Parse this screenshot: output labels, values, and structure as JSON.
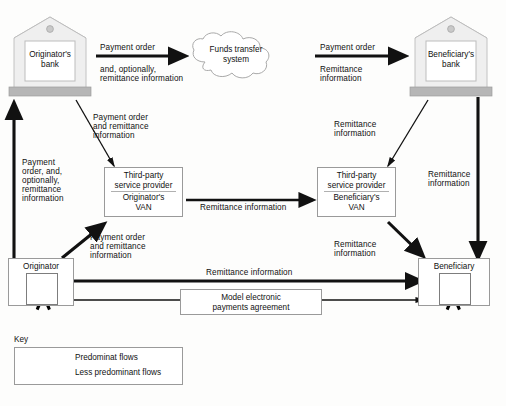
{
  "diagram": {
    "nodes": {
      "originator_bank": {
        "line1": "Originator's",
        "line2": "bank",
        "icon": "bank-icon"
      },
      "beneficiary_bank": {
        "line1": "Beneficiary's",
        "line2": "bank",
        "icon": "bank-icon"
      },
      "funds_transfer_system": {
        "line1": "Funds transfer",
        "line2": "system",
        "shape": "cloud"
      },
      "originator_van": {
        "header1": "Third-party",
        "header2": "service provider",
        "line1": "Originator's",
        "line2": "VAN"
      },
      "beneficiary_van": {
        "header1": "Third-party",
        "header2": "service provider",
        "line1": "Beneficiary's",
        "line2": "VAN"
      },
      "originator": {
        "label": "Originator",
        "icon": "person-icon"
      },
      "beneficiary": {
        "label": "Beneficiary",
        "icon": "person-icon"
      },
      "model_agreement": {
        "line1": "Model electronic",
        "line2": "payments agreement"
      }
    },
    "edge_labels": {
      "ob_to_fts_1": "Payment order",
      "ob_to_fts_2": "and, optionally,",
      "ob_to_fts_3": "remittance information",
      "fts_to_bb_1": "Payment order",
      "fts_to_bb_2": "Remittance",
      "fts_to_bb_3": "information",
      "ob_to_ovan_1": "Payment order",
      "ob_to_ovan_2": "and remittance",
      "ob_to_ovan_3": "information",
      "bb_to_bvan_1": "Remittance",
      "bb_to_bvan_2": "information",
      "ob_up_1": "Payment",
      "ob_up_2": "order, and,",
      "ob_up_3": "optionally,",
      "ob_up_4": "remittance",
      "ob_up_5": "information",
      "bb_down_1": "Remittance",
      "bb_down_2": "information",
      "van_to_van": "Remittance information",
      "orig_to_ovan_1": "Payment order",
      "orig_to_ovan_2": "and remittance",
      "orig_to_ovan_3": "information",
      "bvan_to_benef_1": "Remittance",
      "bvan_to_benef_2": "information",
      "orig_to_benef": "Remittance information"
    },
    "key": {
      "title": "Key",
      "items": [
        {
          "label": "Predominat flows",
          "style": "thick-arrow"
        },
        {
          "label": "Less predominant flows",
          "style": "thin-arrow"
        }
      ]
    },
    "colors": {
      "line": "#111111",
      "bank_fill": "#efefef",
      "bank_stroke": "#b9b9b9",
      "bank_base": "#b6b6b6",
      "cloud_stroke": "#a9a9a9",
      "box_stroke": "#9a9a9a",
      "background": "#fdfdfc"
    }
  }
}
